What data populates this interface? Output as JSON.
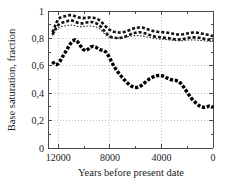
{
  "chart_data": {
    "type": "line",
    "title": "",
    "xlabel": "Years before present date",
    "ylabel": "Base saturation, fraction",
    "xlim": [
      12800,
      0
    ],
    "ylim": [
      0,
      1
    ],
    "x_reversed": true,
    "grid": true,
    "legend_position": "none",
    "x_ticks": [
      12000,
      8000,
      4000,
      0
    ],
    "x_tick_labels": [
      "12000",
      "8000",
      "4000",
      "0"
    ],
    "x_minor_ticks": [
      12000,
      10000,
      8000,
      6000,
      4000,
      2000,
      0
    ],
    "y_ticks": [
      0,
      0.2,
      0.4,
      0.6,
      0.8,
      1
    ],
    "y_tick_labels": [
      "0",
      "0,2",
      "0,4",
      "0,6",
      "0,8",
      "1"
    ],
    "y_minor_ticks": [
      0.1,
      0.3,
      0.5,
      0.7,
      0.9
    ],
    "x": [
      12450,
      12300,
      12150,
      12000,
      11850,
      11700,
      11500,
      11300,
      11100,
      10900,
      10700,
      10500,
      10300,
      10100,
      9900,
      9700,
      9500,
      9300,
      9100,
      8900,
      8700,
      8500,
      8300,
      8100,
      7900,
      7700,
      7500,
      7300,
      7100,
      6900,
      6700,
      6500,
      6300,
      6100,
      5900,
      5700,
      5500,
      5300,
      5100,
      4900,
      4700,
      4500,
      4300,
      4100,
      3900,
      3700,
      3500,
      3300,
      3100,
      2900,
      2700,
      2500,
      2300,
      2100,
      1900,
      1700,
      1500,
      1300,
      1100,
      900,
      700,
      500,
      300,
      100,
      0
    ],
    "series": [
      {
        "name": "upper-curve-thick-dashed",
        "style": "thick-dashed",
        "color": "#111111",
        "values": [
          0.845,
          0.88,
          0.915,
          0.94,
          0.952,
          0.958,
          0.962,
          0.966,
          0.97,
          0.968,
          0.962,
          0.955,
          0.95,
          0.948,
          0.95,
          0.952,
          0.953,
          0.951,
          0.946,
          0.938,
          0.925,
          0.905,
          0.885,
          0.868,
          0.855,
          0.848,
          0.845,
          0.843,
          0.843,
          0.846,
          0.852,
          0.86,
          0.868,
          0.874,
          0.878,
          0.88,
          0.879,
          0.874,
          0.868,
          0.861,
          0.855,
          0.851,
          0.848,
          0.846,
          0.845,
          0.843,
          0.841,
          0.838,
          0.834,
          0.83,
          0.828,
          0.828,
          0.83,
          0.834,
          0.838,
          0.841,
          0.843,
          0.842,
          0.84,
          0.836,
          0.832,
          0.828,
          0.824,
          0.82,
          0.818
        ]
      },
      {
        "name": "second-curve-thick-dashed",
        "style": "thick-dashed",
        "color": "#111111",
        "values": [
          0.828,
          0.855,
          0.88,
          0.898,
          0.908,
          0.915,
          0.92,
          0.926,
          0.932,
          0.93,
          0.922,
          0.914,
          0.91,
          0.91,
          0.914,
          0.918,
          0.92,
          0.918,
          0.912,
          0.902,
          0.885,
          0.862,
          0.84,
          0.822,
          0.81,
          0.805,
          0.803,
          0.803,
          0.805,
          0.81,
          0.818,
          0.826,
          0.834,
          0.84,
          0.844,
          0.845,
          0.843,
          0.838,
          0.831,
          0.824,
          0.818,
          0.813,
          0.81,
          0.808,
          0.806,
          0.804,
          0.802,
          0.799,
          0.796,
          0.793,
          0.792,
          0.793,
          0.796,
          0.8,
          0.804,
          0.807,
          0.808,
          0.807,
          0.805,
          0.802,
          0.798,
          0.794,
          0.79,
          0.786,
          0.784
        ]
      },
      {
        "name": "middle-curve-thin-dotted",
        "style": "thin-dotted",
        "color": "#333333",
        "values": [
          0.82,
          0.842,
          0.862,
          0.876,
          0.884,
          0.888,
          0.891,
          0.894,
          0.897,
          0.896,
          0.892,
          0.888,
          0.886,
          0.886,
          0.888,
          0.89,
          0.891,
          0.889,
          0.884,
          0.876,
          0.862,
          0.842,
          0.824,
          0.812,
          0.806,
          0.803,
          0.802,
          0.802,
          0.803,
          0.806,
          0.81,
          0.814,
          0.818,
          0.82,
          0.821,
          0.82,
          0.818,
          0.814,
          0.81,
          0.806,
          0.802,
          0.799,
          0.797,
          0.795,
          0.794,
          0.792,
          0.79,
          0.788,
          0.786,
          0.784,
          0.783,
          0.783,
          0.784,
          0.786,
          0.788,
          0.789,
          0.789,
          0.788,
          0.787,
          0.785,
          0.783,
          0.781,
          0.779,
          0.777,
          0.776
        ]
      },
      {
        "name": "lower-curve-bold-dashed",
        "style": "bold-dashed",
        "color": "#000000",
        "values": [
          0.632,
          0.612,
          0.608,
          0.616,
          0.636,
          0.662,
          0.692,
          0.724,
          0.756,
          0.78,
          0.79,
          0.775,
          0.748,
          0.722,
          0.71,
          0.72,
          0.738,
          0.742,
          0.736,
          0.724,
          0.716,
          0.712,
          0.7,
          0.672,
          0.636,
          0.6,
          0.57,
          0.545,
          0.522,
          0.5,
          0.48,
          0.462,
          0.45,
          0.443,
          0.442,
          0.448,
          0.46,
          0.476,
          0.492,
          0.506,
          0.516,
          0.524,
          0.529,
          0.53,
          0.526,
          0.518,
          0.508,
          0.5,
          0.496,
          0.494,
          0.488,
          0.472,
          0.448,
          0.42,
          0.392,
          0.366,
          0.344,
          0.326,
          0.31,
          0.3,
          0.296,
          0.3,
          0.306,
          0.302,
          0.292
        ]
      }
    ]
  },
  "axes": {
    "y_title": "Base saturation, fraction",
    "x_title": "Years before present date",
    "y_labels": [
      "1",
      "0,8",
      "0,6",
      "0,4",
      "0,2",
      "0"
    ],
    "x_labels": [
      "12000",
      "8000",
      "4000",
      "0"
    ]
  }
}
